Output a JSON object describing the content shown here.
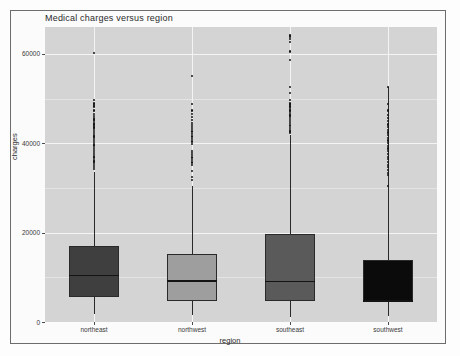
{
  "figure": {
    "title": "Medical charges versus region",
    "panel_bg": "#d4d4d4",
    "frame_border": "#6d6d6d"
  },
  "axes": {
    "y_title": "charges",
    "x_title": "region",
    "y_ticks": [
      "0",
      "20000",
      "40000",
      "60000"
    ],
    "x_ticks": [
      "northeast",
      "northwest",
      "southeast",
      "southwest"
    ]
  },
  "chart_data": {
    "type": "box",
    "title": "Medical charges versus region",
    "xlabel": "region",
    "ylabel": "charges",
    "categories": [
      "northeast",
      "northwest",
      "southeast",
      "southwest"
    ],
    "ylim": [
      0,
      66000
    ],
    "yticks": [
      0,
      20000,
      40000,
      60000
    ],
    "grid": true,
    "legend": "none",
    "boxes": [
      {
        "category": "northeast",
        "fill": "#3f3f3f",
        "q1": 5500,
        "median": 10600,
        "q3": 17000,
        "whisker_low": 1700,
        "whisker_high": 33500,
        "outliers": [
          60200,
          49600,
          48900,
          48600,
          48200,
          47300,
          46600,
          46100,
          45700,
          45300,
          44900,
          44400,
          44200,
          43900,
          43500,
          43100,
          42800,
          42300,
          41900,
          41500,
          41100,
          40700,
          40300,
          39900,
          39500,
          38900,
          38400,
          38000,
          37600,
          37200,
          36800,
          36300,
          35900,
          35500,
          35100,
          34700,
          34300
        ]
      },
      {
        "category": "northwest",
        "fill": "#9e9e9e",
        "q1": 4800,
        "median": 9400,
        "q3": 15200,
        "whisker_low": 1600,
        "whisker_high": 30400,
        "outliers": [
          55100,
          48700,
          47300,
          46500,
          45900,
          45200,
          44600,
          44100,
          43600,
          43100,
          42600,
          42000,
          41500,
          41000,
          40400,
          39900,
          38300,
          37800,
          37300,
          36800,
          36200,
          35700,
          35200,
          33800,
          32500,
          31700
        ]
      },
      {
        "category": "southeast",
        "fill": "#5a5a5a",
        "q1": 4800,
        "median": 9200,
        "q3": 19800,
        "whisker_low": 1100,
        "whisker_high": 41900,
        "outliers": [
          64100,
          63800,
          63400,
          62600,
          60500,
          58600,
          52600,
          51200,
          49600,
          48900,
          48700,
          48500,
          48200,
          47900,
          47500,
          47300,
          47000,
          46600,
          46200,
          45800,
          45400,
          44900,
          44500,
          44100,
          43800,
          43400,
          43000,
          42600,
          42200
        ]
      },
      {
        "category": "southwest",
        "fill": "#0b0b0b",
        "q1": 4800,
        "median": 4900,
        "q3": 13800,
        "whisker_low": 1300,
        "whisker_high": 52600,
        "outliers": [
          52600,
          48700,
          47300,
          46300,
          45600,
          44900,
          44200,
          43600,
          43000,
          42400,
          41800,
          41200,
          40600,
          40000,
          39400,
          38800,
          38200,
          37600,
          37000,
          36400,
          35800,
          35200,
          34600,
          34000,
          33400,
          32800,
          30400
        ]
      }
    ]
  }
}
